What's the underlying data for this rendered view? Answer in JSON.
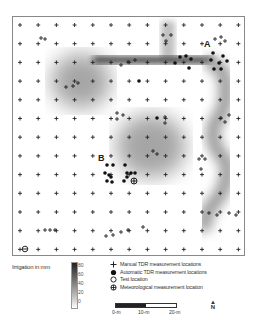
{
  "map": {
    "site_labels": [
      {
        "text": "A",
        "x": 203,
        "y": 38
      },
      {
        "text": "B",
        "x": 97,
        "y": 152
      }
    ],
    "grid": {
      "origin_x": 19,
      "origin_y": 24,
      "step_x": 18.2,
      "step_y": 18.7,
      "cols": 13,
      "rows": 13
    }
  },
  "legend": {
    "colorbar_title": "Irrigation in mm",
    "colorbar_ticks": [
      "80",
      "60",
      "40",
      "20",
      "0"
    ],
    "items": [
      {
        "symbol": "plus",
        "label": "Manual TDR measurement locations"
      },
      {
        "symbol": "filled-circle",
        "label": "Automatic TDR measurement locations"
      },
      {
        "symbol": "open-circle",
        "label": "Test location"
      },
      {
        "symbol": "circle-cross",
        "label": "Meteorological measurement location"
      }
    ]
  },
  "scale_bar": {
    "ticks": [
      "0-m",
      "10-m",
      "20-m"
    ]
  },
  "north_arrow": {
    "label": "N"
  }
}
